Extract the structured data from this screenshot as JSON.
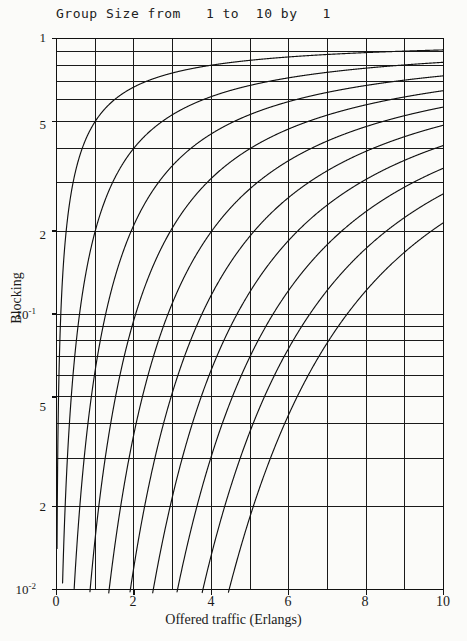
{
  "chart_data": {
    "type": "line",
    "title": "Group Size from   1 to  10 by   1",
    "xlabel": "Offered traffic (Erlangs)",
    "ylabel": "Blocking",
    "xlim": [
      0,
      10
    ],
    "ylim": [
      0.01,
      1
    ],
    "yscale": "log",
    "xscale": "linear",
    "grid": true,
    "legend": "none",
    "xticks": [
      0,
      2,
      4,
      6,
      8,
      10
    ],
    "xtick_labels": [
      "0",
      "2",
      "4",
      "6",
      "8",
      "10"
    ],
    "yticks": [
      1,
      0.5,
      0.2,
      0.1,
      0.05,
      0.02,
      0.01
    ],
    "ytick_labels": [
      "1",
      "5",
      "2",
      "10-1",
      "5",
      "2",
      "10-2"
    ],
    "ygrid_values": [
      1,
      0.9,
      0.8,
      0.7,
      0.6,
      0.5,
      0.4,
      0.3,
      0.2,
      0.1,
      0.09,
      0.08,
      0.07,
      0.06,
      0.05,
      0.04,
      0.03,
      0.02,
      0.01
    ],
    "xgrid_values": [
      0,
      1,
      2,
      3,
      4,
      5,
      6,
      7,
      8,
      9,
      10
    ],
    "x": [
      0.01,
      0.02,
      0.03,
      0.05,
      0.08,
      0.12,
      0.16,
      0.2,
      0.3,
      0.4,
      0.5,
      0.6,
      0.8,
      1.0,
      1.2,
      1.5,
      1.8,
      2.0,
      2.5,
      3.0,
      3.5,
      4.0,
      4.5,
      5.0,
      5.5,
      6.0,
      6.5,
      7.0,
      7.5,
      8.0,
      8.5,
      9.0,
      9.5,
      10.0
    ],
    "series": [
      {
        "name": "N=1",
        "group_size": 1,
        "values": [
          0.0099,
          0.0196,
          0.0291,
          0.0476,
          0.0741,
          0.1071,
          0.1379,
          0.1667,
          0.2308,
          0.2857,
          0.3333,
          0.375,
          0.4444,
          0.5,
          0.5455,
          0.6,
          0.6429,
          0.6667,
          0.7143,
          0.75,
          0.7778,
          0.8,
          0.8182,
          0.8333,
          0.8462,
          0.8571,
          0.8667,
          0.875,
          0.8824,
          0.8889,
          0.8947,
          0.9,
          0.9048,
          0.9091
        ]
      },
      {
        "name": "N=2",
        "group_size": 2,
        "values": [
          5e-05,
          0.0002,
          0.0004,
          0.0012,
          0.003,
          0.0064,
          0.0111,
          0.0164,
          0.0342,
          0.0541,
          0.0741,
          0.0931,
          0.127,
          0.1538,
          0.1756,
          0.2,
          0.2172,
          0.2258,
          0.2428,
          0.2553,
          0.2649,
          0.2727,
          0.2791,
          0.2846,
          0.2892,
          0.2932,
          0.2967,
          0.2998,
          0.3025,
          0.305,
          0.3072,
          0.3093,
          0.3111,
          0.3128
        ]
      },
      {
        "name": "N=3",
        "group_size": 3,
        "values": [
          2e-07,
          1.3e-06,
          4.5e-06,
          2e-05,
          8e-05,
          0.00025,
          0.00059,
          0.0011,
          0.00347,
          0.00719,
          0.01202,
          0.01763,
          0.03022,
          0.04255,
          0.05383,
          0.06838,
          0.08007,
          0.08648,
          0.09983,
          0.1099,
          0.1177,
          0.1238,
          0.1287,
          0.1328,
          0.1362,
          0.1391,
          0.1415,
          0.1437,
          0.1456,
          0.1472,
          0.1487,
          0.15,
          0.1512,
          0.1523
        ]
      },
      {
        "name": "N=4",
        "group_size": 4,
        "values": [
          5e-10,
          7e-09,
          3e-08,
          3e-07,
          1.6e-06,
          7.6e-06,
          2.4e-05,
          5.5e-05,
          0.00026,
          0.00071,
          0.00152,
          0.00269,
          0.00615,
          0.01075,
          0.01608,
          0.02425,
          0.03201,
          0.03687,
          0.04828,
          0.0578,
          0.06567,
          0.0722,
          0.07767,
          0.08231,
          0.08627,
          0.08969,
          0.09267,
          0.09528,
          0.09759,
          0.09964,
          0.1015,
          0.1031,
          0.1046,
          0.106
        ]
      },
      {
        "name": "N=5",
        "group_size": 5,
        "values": [
          1e-12,
          1e-11,
          6e-11,
          4e-10,
          3e-09,
          2e-08,
          8e-08,
          2.2e-07,
          1.6e-06,
          5.8e-06,
          1.5e-05,
          3.3e-05,
          0.0001,
          0.00022,
          0.00039,
          0.00077,
          0.00132,
          0.00167,
          0.00277,
          0.00394,
          0.00509,
          0.00618,
          0.0072,
          0.00813,
          0.00898,
          0.00975,
          0.01046,
          0.0111,
          0.01169,
          0.01223,
          0.01272,
          0.01318,
          0.0136,
          0.01399
        ]
      },
      {
        "name": "N=6",
        "group_size": 6,
        "values": [
          2e-15,
          1e-13,
          1e-12,
          1e-11,
          1e-10,
          1e-09,
          5e-09,
          1.5e-08,
          1.6e-07,
          7.7e-07,
          2.5e-06,
          6.7e-06,
          2.7e-05,
          7.3e-05,
          0.00016,
          0.00038,
          0.00076,
          0.00105,
          0.00217,
          0.00358,
          0.00513,
          0.00671,
          0.00827,
          0.00977,
          0.0112,
          0.01254,
          0.01381,
          0.01499,
          0.0161,
          0.01713,
          0.0181,
          0.019,
          0.01985,
          0.02064
        ]
      },
      {
        "name": "N=7",
        "group_size": 7,
        "values": [
          3e-18,
          3e-16,
          4e-15,
          5e-14,
          8e-13,
          1e-11,
          7e-11,
          2.5e-10,
          4e-09,
          2.2e-08,
          9e-08,
          2.8e-07,
          1.4e-06,
          4.7e-06,
          1.2e-05,
          3.3e-05,
          7.6e-05,
          0.00011,
          0.00027,
          0.00052,
          0.00085,
          0.00123,
          0.00166,
          0.00212,
          0.00259,
          0.00307,
          0.00355,
          0.00402,
          0.00449,
          0.00495,
          0.0054,
          0.00584,
          0.00627,
          0.00668
        ]
      },
      {
        "name": "N=8",
        "group_size": 8,
        "values": [
          4e-21,
          8e-19,
          2e-17,
          3e-16,
          8e-15,
          1.6e-13,
          1.4e-12,
          6e-12,
          1.4e-10,
          1.1e-09,
          5.6e-09,
          2.1e-08,
          1.4e-07,
          5.9e-07,
          1.8e-06,
          6.1e-06,
          1.6e-05,
          2.6e-05,
          7.6e-05,
          0.000167,
          0.00031,
          0.00049,
          0.00072,
          0.00099,
          0.00129,
          0.00161,
          0.00195,
          0.0023,
          0.00266,
          0.00303,
          0.0034,
          0.00376,
          0.00413,
          0.00449
        ]
      },
      {
        "name": "N=9",
        "group_size": 9,
        "values": [
          4e-24,
          2e-21,
          7e-20,
          2e-18,
          8e-17,
          2e-15,
          2.5e-14,
          1.3e-13,
          4.6e-12,
          4.9e-11,
          3.1e-10,
          1.4e-09,
          1.3e-08,
          6.5e-08,
          2.4e-07,
          1e-06,
          3.1e-06,
          5.7e-06,
          1.9e-05,
          4.7e-05,
          9.7e-05,
          0.00017,
          0.00027,
          0.0004,
          0.00056,
          0.00073,
          0.00093,
          0.00114,
          0.00136,
          0.0016,
          0.00184,
          0.00209,
          0.00234,
          0.00259
        ]
      },
      {
        "name": "N=10",
        "group_size": 10,
        "values": [
          4e-27,
          4e-24,
          2e-22,
          9e-21,
          6e-19,
          2.4e-17,
          4e-16,
          2.6e-15,
          1.4e-13,
          2e-12,
          1.6e-11,
          8.5e-11,
          1.1e-09,
          6.6e-09,
          2.9e-08,
          1.5e-07,
          5.5e-07,
          1.1e-06,
          4.4e-06,
          1.2e-05,
          2.8e-05,
          5.3e-05,
          9e-05,
          0.00014,
          0.00021,
          0.00029,
          0.00039,
          0.0005,
          0.00063,
          0.00077,
          0.00093,
          0.0011,
          0.00127,
          0.00146
        ]
      }
    ]
  },
  "axes": {
    "xtitle": "Offered traffic (Erlangs)",
    "ytitle": "Blocking",
    "ytick_1": "1",
    "ytick_05": "5",
    "ytick_02": "2",
    "ytick_01_base": "10",
    "ytick_01_exp": "-1",
    "ytick_005": "5",
    "ytick_002": "2",
    "ytick_001_base": "10",
    "ytick_001_exp": "-2",
    "xtick_0": "0",
    "xtick_2": "2",
    "xtick_4": "4",
    "xtick_6": "6",
    "xtick_8": "8",
    "xtick_10": "10"
  },
  "style": {
    "line_color": "#111111",
    "grid_color": "#1a1a1a",
    "frame_color": "#111111",
    "background": "#fbfbf9"
  }
}
